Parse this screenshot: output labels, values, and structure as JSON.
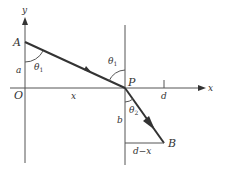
{
  "diagram": {
    "type": "refraction-geometry",
    "labels": {
      "y_axis": "y",
      "x_axis": "x",
      "origin": "O",
      "point_a": "A",
      "point_p": "P",
      "point_b": "B",
      "seg_a": "a",
      "seg_x": "x",
      "seg_d": "d",
      "seg_b": "b",
      "seg_d_minus_x": "d−x",
      "theta1_left": "θ",
      "theta1_left_sub": "1",
      "theta1_right": "θ",
      "theta1_right_sub": "1",
      "theta2": "θ",
      "theta2_sub": "2"
    },
    "colors": {
      "axis": "#555555",
      "ray": "#333333",
      "background": "#ffffff"
    }
  }
}
